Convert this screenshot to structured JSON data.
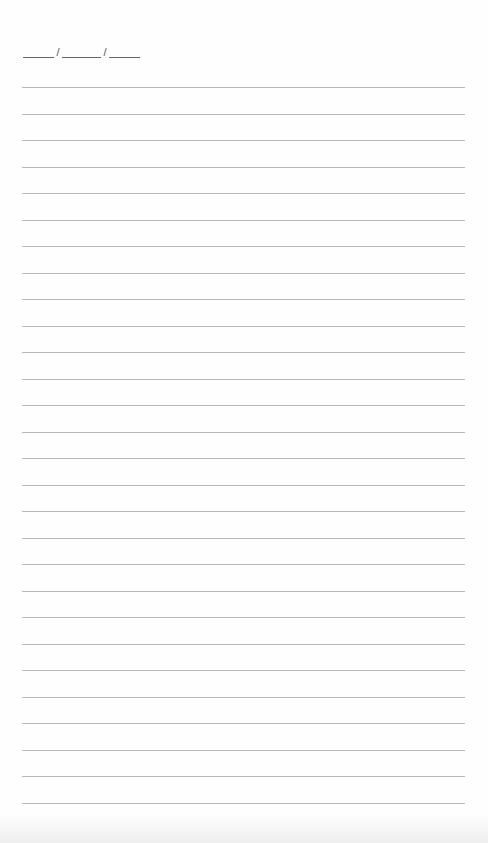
{
  "page": {
    "type": "lined-notebook-page",
    "background_color": "#fefefe",
    "rule_color": "#b9b9b9"
  },
  "date_field": {
    "separator": "/",
    "blanks": [
      "",
      "",
      ""
    ]
  },
  "lines": {
    "count": 28,
    "first_y": 87,
    "spacing": 26.5,
    "entries": [
      "",
      "",
      "",
      "",
      "",
      "",
      "",
      "",
      "",
      "",
      "",
      "",
      "",
      "",
      "",
      "",
      "",
      "",
      "",
      "",
      "",
      "",
      "",
      "",
      "",
      "",
      "",
      ""
    ]
  }
}
